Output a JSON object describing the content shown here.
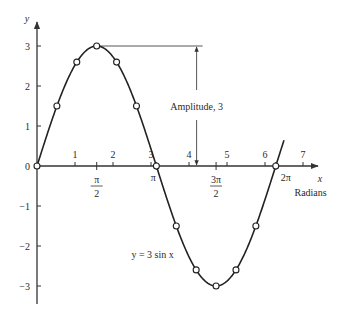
{
  "chart_data": {
    "type": "line",
    "title": "",
    "function_label": "y = 3 sin x",
    "xlabel": "x",
    "xlabel_units": "Radians",
    "ylabel": "y",
    "xlim": [
      0,
      7.5
    ],
    "ylim": [
      -3.5,
      3.5
    ],
    "x_ticks": [
      {
        "value": 1,
        "label": "1"
      },
      {
        "value": 2,
        "label": "2"
      },
      {
        "value": 3,
        "label": "3"
      },
      {
        "value": 4,
        "label": "4"
      },
      {
        "value": 5,
        "label": "5"
      },
      {
        "value": 6,
        "label": "6"
      },
      {
        "value": 7,
        "label": "7"
      }
    ],
    "pi_ticks": [
      {
        "value": 1.5708,
        "num": "π",
        "den": "2"
      },
      {
        "value": 3.1416,
        "label": "π"
      },
      {
        "value": 4.7124,
        "num": "3π",
        "den": "2"
      },
      {
        "value": 6.2832,
        "label": "2π"
      }
    ],
    "y_ticks": [
      {
        "value": 3,
        "label": "3"
      },
      {
        "value": 2,
        "label": "2"
      },
      {
        "value": 1,
        "label": "1"
      },
      {
        "value": 0,
        "label": "0"
      },
      {
        "value": -1,
        "label": "−1"
      },
      {
        "value": -2,
        "label": "−2"
      },
      {
        "value": -3,
        "label": "−3"
      }
    ],
    "series": [
      {
        "name": "y = 3 sin x",
        "amplitude": 3,
        "x_range": [
          0,
          6.5
        ],
        "points": [
          [
            0,
            0
          ],
          [
            0.5236,
            1.5
          ],
          [
            1.0472,
            2.598
          ],
          [
            1.5708,
            3
          ],
          [
            2.0944,
            2.598
          ],
          [
            2.618,
            1.5
          ],
          [
            3.1416,
            0
          ],
          [
            3.6652,
            -1.5
          ],
          [
            4.1888,
            -2.598
          ],
          [
            4.7124,
            -3
          ],
          [
            5.236,
            -2.598
          ],
          [
            5.7596,
            -1.5
          ],
          [
            6.2832,
            0
          ]
        ]
      }
    ],
    "annotations": [
      {
        "text": "Amplitude, 3",
        "x": 4.2,
        "from_y": 0,
        "to_y": 3
      }
    ],
    "grid": false,
    "legend": "none"
  }
}
